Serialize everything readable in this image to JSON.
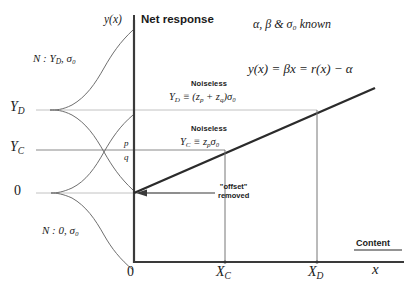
{
  "figure": {
    "header_left": "y(x)",
    "header_right": "Net response",
    "known_note": "α, β  &  σ₀  known",
    "line_equation": "y(x) = βx = r(x) − α",
    "content_axis_label": "Content",
    "content_axis_var": "x",
    "origin_label_y": "0",
    "origin_label_x": "0"
  },
  "y_axis": {
    "ticks": [
      {
        "name": "Y_D",
        "label": "Y",
        "sub": "D",
        "y": 110
      },
      {
        "name": "Y_C",
        "label": "Y",
        "sub": "C",
        "y": 150
      },
      {
        "name": "zero",
        "label": "0",
        "sub": "",
        "y": 193
      }
    ]
  },
  "x_axis": {
    "ticks": [
      {
        "name": "X_C",
        "label": "X",
        "sub": "C",
        "x": 225
      },
      {
        "name": "X_D",
        "label": "X",
        "sub": "D",
        "x": 317
      }
    ]
  },
  "distributions": [
    {
      "name": "upper",
      "label": "N : Y",
      "sub": "D",
      "tail": ", σ₀",
      "center_y": 110
    },
    {
      "name": "lower",
      "label": "N : 0, σ₀",
      "sub": "",
      "tail": "",
      "center_y": 193
    }
  ],
  "annotations": {
    "noiseless_d": {
      "title": "Noiseless",
      "eq_lead": "Y",
      "eq_sub": "D",
      "eq_tail": " ≡ (z",
      "eq_sub2": "p",
      "eq_mid": " + z",
      "eq_sub3": "q",
      "eq_end": ")σ₀"
    },
    "noiseless_c": {
      "title": "Noiseless",
      "eq_lead": "Y",
      "eq_sub": "C",
      "eq_tail": " ≡ z",
      "eq_sub2": "p",
      "eq_end": "σ₀"
    },
    "offset": {
      "line1": "\"offset\"",
      "line2": "removed"
    },
    "region_p": "p",
    "region_q": "q"
  },
  "colors": {
    "axis": "#3a3a3a",
    "curve": "#6f6f6f",
    "guide_light": "#c4c4c4",
    "guide_dark": "#7a7a7a",
    "response_line": "#2b2b2b",
    "text": "#1a1a1a",
    "background": "#ffffff"
  }
}
